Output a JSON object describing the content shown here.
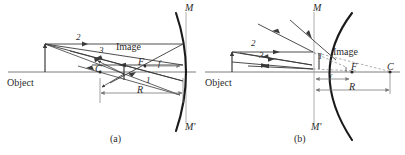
{
  "figure": {
    "width": 405,
    "height": 155,
    "background": "#ffffff",
    "ink": "#2b2b2b",
    "ray_color": "#3a3a3a",
    "mirror_color": "#1a1a1a",
    "axis_color": "#6e6e6e",
    "dimension_color": "#7a7a7a",
    "dashed_color": "#8a8a8a"
  },
  "panels": [
    {
      "id": "a",
      "caption": "(a)",
      "caption_pos": {
        "x": 110,
        "y": 134
      },
      "object_label": "Object",
      "object_label_pos": {
        "x": 7,
        "y": 78
      },
      "image_label": "Image",
      "image_label_pos": {
        "x": 116,
        "y": 42
      },
      "ray_labels": [
        {
          "text": "2",
          "x": 76,
          "y": 33
        },
        {
          "text": "3",
          "x": 99,
          "y": 46
        },
        {
          "text": "1",
          "x": 146,
          "y": 76
        }
      ],
      "point_labels": [
        {
          "text": "M",
          "x": 185,
          "y": 4
        },
        {
          "text": "M'",
          "x": 185,
          "y": 123
        },
        {
          "text": "F",
          "x": 138,
          "y": 58
        },
        {
          "text": "C",
          "x": 95,
          "y": 65
        }
      ],
      "dimension_labels": [
        {
          "text": "f",
          "x": 157,
          "y": 61
        },
        {
          "text": "R",
          "x": 137,
          "y": 84
        }
      ],
      "axis_y": 72,
      "mirror_vertex_x": 183
    },
    {
      "id": "b",
      "caption": "(b)",
      "caption_pos": {
        "x": 294,
        "y": 134
      },
      "object_label": "Object",
      "object_label_pos": {
        "x": 205,
        "y": 78
      },
      "image_label": "Image",
      "image_label_pos": {
        "x": 333,
        "y": 47
      },
      "ray_labels": [
        {
          "text": "2",
          "x": 251,
          "y": 40
        },
        {
          "text": "3",
          "x": 259,
          "y": 52
        },
        {
          "text": "1",
          "x": 317,
          "y": 54
        }
      ],
      "point_labels": [
        {
          "text": "M",
          "x": 313,
          "y": 4
        },
        {
          "text": "M'",
          "x": 313,
          "y": 123
        },
        {
          "text": "F",
          "x": 352,
          "y": 72
        },
        {
          "text": "C",
          "x": 387,
          "y": 72
        }
      ],
      "dimension_labels": [
        {
          "text": "f",
          "x": 333,
          "y": 73
        },
        {
          "text": "R",
          "x": 350,
          "y": 84
        }
      ],
      "axis_y": 72,
      "mirror_vertex_x": 314
    }
  ]
}
